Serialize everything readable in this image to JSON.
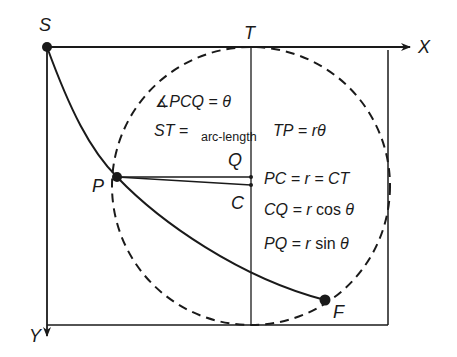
{
  "diagram": {
    "type": "brachistochrone-cycloid-construction",
    "colors": {
      "stroke": "#1a1a1a",
      "background": "#ffffff"
    },
    "points": {
      "S": {
        "label": "S",
        "x": 47,
        "y": 47
      },
      "T": {
        "label": "T",
        "x": 251,
        "y": 47
      },
      "P": {
        "label": "P",
        "x": 117,
        "y": 177
      },
      "Q": {
        "label": "Q",
        "x": 251,
        "y": 177
      },
      "C": {
        "label": "C",
        "x": 251,
        "y": 185
      },
      "F": {
        "label": "F",
        "x": 325,
        "y": 300
      }
    },
    "axes": {
      "x_label": "X",
      "y_label": "Y"
    },
    "circle": {
      "cx": 251,
      "cy": 186,
      "r": 139,
      "style": "dashed"
    },
    "equations": {
      "angle": {
        "prefix": "∡",
        "lhs": "PCQ",
        "eq": " = ",
        "rhs": "θ"
      },
      "st": {
        "lhs": "ST",
        "eq": " = ",
        "sub": "arc-length"
      },
      "tp": {
        "lhs": "TP",
        "eq": " = ",
        "rhs": "rθ"
      },
      "pc": {
        "text": "PC = r = CT"
      },
      "cq": {
        "lhs": "CQ = r",
        "fn": " cos ",
        "var": "θ"
      },
      "pq": {
        "lhs": "PQ = r",
        "fn": " sin ",
        "var": "θ"
      }
    }
  }
}
